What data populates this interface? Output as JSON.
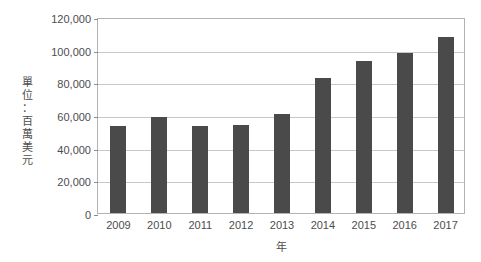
{
  "chart_data": {
    "type": "bar",
    "title": "",
    "subtitle": "",
    "xlabel": "年",
    "ylabel": "單位：百萬美元",
    "ylabel_chars": [
      "單",
      "位",
      "：",
      "百",
      "萬",
      "美",
      "元"
    ],
    "categories": [
      "2009",
      "2010",
      "2011",
      "2012",
      "2013",
      "2014",
      "2015",
      "2016",
      "2017"
    ],
    "values": [
      53000,
      58500,
      53500,
      54000,
      60500,
      82500,
      93000,
      98000,
      108000
    ],
    "ylim": [
      0,
      120000
    ],
    "ytick_values": [
      0,
      20000,
      40000,
      60000,
      80000,
      100000,
      120000
    ],
    "ytick_labels": [
      "0",
      "20,000",
      "40,000",
      "60,000",
      "80,000",
      "100,000",
      "120,000"
    ],
    "grid": true,
    "legend": "none",
    "bar_color": "#4a4a4a",
    "grid_color": "#c8c8c8",
    "frame_color": "#b3b3b3",
    "background_color": "#ffffff",
    "text_color": "#4d4d4d"
  }
}
